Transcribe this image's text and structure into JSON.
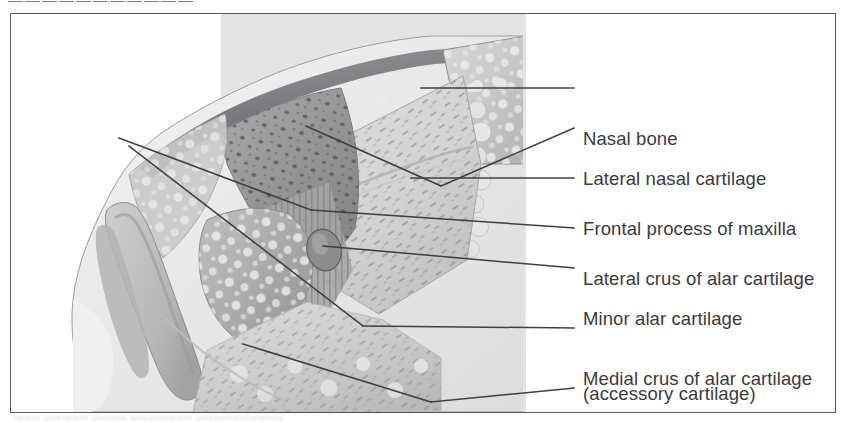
{
  "figure": {
    "type": "anatomical-illustration",
    "modality": "grayscale medical illustration",
    "frame": {
      "border_color": "#58585a",
      "background": "#ffffff"
    },
    "panel_background": "#e3e3e3",
    "label_color": "#3b3b3d",
    "leader_color": "#3f3f41"
  },
  "top_remnant": {
    "text": "———————————"
  },
  "caption_remnant": {
    "text": "░░░ ░░░░░ ░░░░ ░░░░░░░ ░░░░░░░░░░"
  },
  "labels": [
    {
      "id": "nasal-bone",
      "line1": "Nasal bone",
      "line2": "",
      "y": 74
    },
    {
      "id": "lateral-nasal-cartilage",
      "line1": "Lateral nasal cartilage",
      "line2": "",
      "y": 114
    },
    {
      "id": "frontal-process-of-maxilla",
      "line1": "Frontal process of maxilla",
      "line2": "",
      "y": 164
    },
    {
      "id": "lateral-crus-alar",
      "line1": "Lateral crus of alar cartilage",
      "line2": "",
      "y": 214
    },
    {
      "id": "minor-alar-cartilage",
      "line1": "Minor alar cartilage",
      "line2": "(accessory cartilage)",
      "y": 254
    },
    {
      "id": "medial-crus-alar",
      "line1": "Medial crus of alar cartilage",
      "line2": "",
      "y": 314
    },
    {
      "id": "fatty-tissue",
      "line1": "Fatty tissue",
      "line2": "",
      "y": 374
    }
  ],
  "structures": [
    {
      "id": "skin-soft-tissue",
      "name": "Skin and subcutaneous soft tissue envelope",
      "tone": "#ececec"
    },
    {
      "id": "nasal-bone",
      "name": "Nasal bone",
      "tone": "#bdbdbd"
    },
    {
      "id": "lateral-nasal-cartilage",
      "name": "Lateral nasal cartilage",
      "tone": "#9a9a9a"
    },
    {
      "id": "frontal-process-maxilla",
      "name": "Frontal process of maxilla",
      "tone": "#d8d8d8"
    },
    {
      "id": "lateral-crus",
      "name": "Lateral crus of alar cartilage",
      "tone": "#aeaeae"
    },
    {
      "id": "minor-alar-cartilage",
      "name": "Minor alar cartilage",
      "tone": "#8f8f8f"
    },
    {
      "id": "medial-crus",
      "name": "Medial crus of alar cartilage",
      "tone": "#c4c4c4"
    },
    {
      "id": "fatty-tissue",
      "name": "Fatty tissue",
      "tone": "#d0d0d0"
    },
    {
      "id": "nasal-vestibule",
      "name": "Nasal vestibule / nostril lumen",
      "tone": "#bfbfbf"
    }
  ]
}
